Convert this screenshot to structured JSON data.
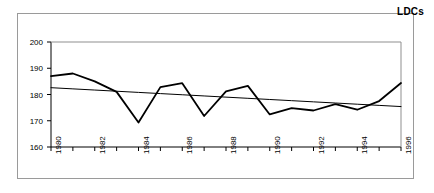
{
  "chart_data": {
    "type": "line",
    "title": "LDCs",
    "xlabel": "",
    "ylabel": "",
    "ylim": [
      160,
      200
    ],
    "yticks": [
      160,
      170,
      180,
      190,
      200
    ],
    "xlim": [
      1980,
      1996
    ],
    "grid": false,
    "legend": "none",
    "x": [
      1980,
      1981,
      1982,
      1983,
      1984,
      1985,
      1986,
      1987,
      1988,
      1989,
      1990,
      1991,
      1992,
      1993,
      1994,
      1995,
      1996
    ],
    "xtick_labels": [
      "1980",
      "",
      "1982",
      "",
      "1984",
      "",
      "1986",
      "",
      "1988",
      "",
      "1990",
      "",
      "1992",
      "",
      "1994",
      "",
      "1996"
    ],
    "series": [
      {
        "name": "LDCs",
        "type": "line",
        "color": "#000000",
        "values": [
          187.0,
          188.0,
          185.0,
          181.0,
          169.3,
          182.8,
          184.3,
          171.8,
          181.2,
          183.3,
          172.4,
          174.8,
          173.9,
          176.3,
          174.2,
          177.5,
          184.4
        ]
      },
      {
        "name": "linear trend",
        "type": "trendline",
        "color": "#000000",
        "values": [
          182.6,
          182.15,
          181.7,
          181.25,
          180.8,
          180.35,
          179.9,
          179.45,
          179.0,
          178.55,
          178.1,
          177.65,
          177.2,
          176.75,
          176.3,
          175.85,
          175.4
        ]
      }
    ]
  },
  "figure": {
    "title_text": "LDCs"
  }
}
